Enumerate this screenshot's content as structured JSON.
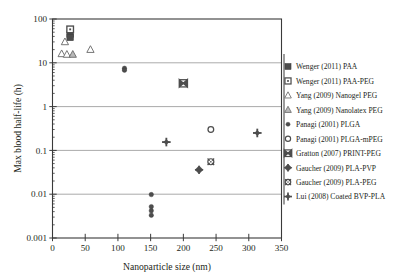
{
  "chart_data": {
    "type": "scatter",
    "title": "",
    "xlabel": "Nanoparticle size (nm)",
    "ylabel": "Max blood half-life (h)",
    "xlim": [
      0,
      350
    ],
    "ylim": [
      0.001,
      100
    ],
    "yscale": "log",
    "xscale": "linear",
    "xticks": [
      0,
      50,
      100,
      150,
      200,
      250,
      300,
      350
    ],
    "xtick_labels": [
      "0",
      "50",
      "100",
      "150",
      "200",
      "250",
      "300",
      "350"
    ],
    "yticks": [
      0.001,
      0.01,
      0.1,
      1,
      10,
      100
    ],
    "ytick_labels": [
      "0.001",
      "0.01",
      "0.1",
      "1",
      "10",
      "100"
    ],
    "grid": "horizontal-major",
    "legend_position": "right-outside",
    "series": [
      {
        "name": "Wenger (2011) PAA",
        "marker": "filled-square",
        "points": [
          [
            27,
            45
          ],
          [
            27,
            38
          ]
        ]
      },
      {
        "name": "Wenger (2011) PAA-PEG",
        "marker": "open-square-dot",
        "points": [
          [
            27,
            58
          ]
        ]
      },
      {
        "name": "Yang (2009) Nanogel PEG",
        "marker": "open-triangle",
        "points": [
          [
            19,
            30
          ],
          [
            14,
            16
          ],
          [
            22,
            15.5
          ],
          [
            58,
            20
          ]
        ]
      },
      {
        "name": "Yang (2009) Nanolatex PEG",
        "marker": "shaded-triangle",
        "points": [
          [
            31,
            15.5
          ]
        ]
      },
      {
        "name": "Panagi (2001) PLGA",
        "marker": "small-filled-circle",
        "points": [
          [
            110,
            7.5
          ],
          [
            110,
            6.8
          ],
          [
            151,
            0.0098
          ],
          [
            151,
            0.0052
          ],
          [
            151,
            0.0042
          ],
          [
            151,
            0.0033
          ]
        ]
      },
      {
        "name": "Panagi (2001) PLGA-mPEG",
        "marker": "open-circle",
        "points": [
          [
            242,
            0.3
          ]
        ]
      },
      {
        "name": "Gratton (2007) PRINT-PEG",
        "marker": "bowtie",
        "points": [
          [
            200,
            3.4
          ]
        ]
      },
      {
        "name": "Gaucher (2009) PLA-PVP",
        "marker": "filled-diamond-plus",
        "points": [
          [
            224,
            0.036
          ]
        ]
      },
      {
        "name": "Gaucher (2009) PLA-PEG",
        "marker": "gear-circle",
        "points": [
          [
            242,
            0.055
          ]
        ]
      },
      {
        "name": "Lui (2008) Coated BVP-PLA",
        "marker": "bold-plus-diamond",
        "points": [
          [
            174,
            0.155
          ],
          [
            313,
            0.25
          ]
        ]
      }
    ]
  },
  "axes": {
    "y_title": "Max blood half-life (h)",
    "x_title": "Nanoparticle size (nm)"
  },
  "legend": {
    "items": [
      {
        "label": "Wenger (2011) PAA",
        "marker": "filled-square"
      },
      {
        "label": "Wenger (2011) PAA-PEG",
        "marker": "open-square-dot"
      },
      {
        "label": "Yang (2009) Nanogel PEG",
        "marker": "open-triangle"
      },
      {
        "label": "Yang (2009) Nanolatex PEG",
        "marker": "shaded-triangle"
      },
      {
        "label": "Panagi (2001) PLGA",
        "marker": "small-filled-circle"
      },
      {
        "label": "Panagi (2001) PLGA-mPEG",
        "marker": "open-circle"
      },
      {
        "label": "Gratton (2007) PRINT-PEG",
        "marker": "bowtie"
      },
      {
        "label": "Gaucher (2009) PLA-PVP",
        "marker": "filled-diamond-plus"
      },
      {
        "label": "Gaucher (2009) PLA-PEG",
        "marker": "gear-circle"
      },
      {
        "label": "Lui (2008) Coated BVP-PLA",
        "marker": "bold-plus-diamond"
      }
    ]
  },
  "colors": {
    "marker_dark": "#4d4d4d",
    "marker_outline": "#6f6f6f",
    "axis": "#3a3a3a",
    "grid": "#9b9b9b",
    "text": "#231f20",
    "background": "#ffffff"
  },
  "xtick_labels": [
    "0",
    "50",
    "100",
    "150",
    "200",
    "250",
    "300",
    "350"
  ],
  "ytick_labels": [
    "0.001",
    "0.01",
    "0.1",
    "1",
    "10",
    "100"
  ]
}
